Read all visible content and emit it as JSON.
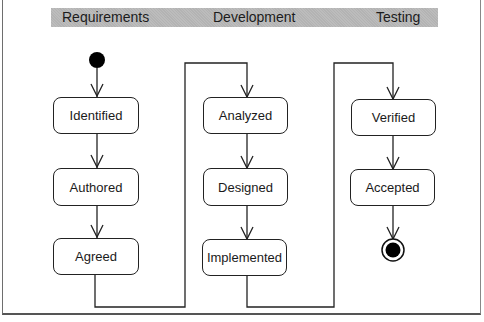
{
  "diagram": {
    "type": "uml-activity",
    "swimlanes": [
      {
        "label": "Requirements"
      },
      {
        "label": "Development"
      },
      {
        "label": "Testing"
      }
    ],
    "states": [
      {
        "id": "identified",
        "label": "Identified",
        "lane": "Requirements"
      },
      {
        "id": "authored",
        "label": "Authored",
        "lane": "Requirements"
      },
      {
        "id": "agreed",
        "label": "Agreed",
        "lane": "Requirements"
      },
      {
        "id": "analyzed",
        "label": "Analyzed",
        "lane": "Development"
      },
      {
        "id": "designed",
        "label": "Designed",
        "lane": "Development"
      },
      {
        "id": "implemented",
        "label": "Implemented",
        "lane": "Development"
      },
      {
        "id": "verified",
        "label": "Verified",
        "lane": "Testing"
      },
      {
        "id": "accepted",
        "label": "Accepted",
        "lane": "Testing"
      }
    ],
    "transitions": [
      [
        "start",
        "Identified"
      ],
      [
        "Identified",
        "Authored"
      ],
      [
        "Authored",
        "Agreed"
      ],
      [
        "Agreed",
        "Analyzed"
      ],
      [
        "Analyzed",
        "Designed"
      ],
      [
        "Designed",
        "Implemented"
      ],
      [
        "Implemented",
        "Verified"
      ],
      [
        "Verified",
        "Accepted"
      ],
      [
        "Accepted",
        "end"
      ]
    ],
    "colors": {
      "lane_band": "#b3b3b3",
      "stroke": "#222222",
      "text": "#1a1a1a"
    }
  }
}
